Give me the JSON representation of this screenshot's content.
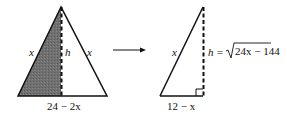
{
  "left_triangle": {
    "side_left_label": "x",
    "side_right_label": "x",
    "height_label": "h",
    "base_label": "24 − 2x",
    "shaded_half": "left"
  },
  "arrow": {
    "direction": "right"
  },
  "right_triangle": {
    "hypotenuse_label": "x",
    "height_label_prefix": "h = ",
    "height_label_radicand": "24x − 144",
    "base_label": "12 − x",
    "right_angle_marker": true
  },
  "colors": {
    "stroke": "#111111",
    "shade": "#6e6e6e",
    "background": "#ffffff"
  }
}
